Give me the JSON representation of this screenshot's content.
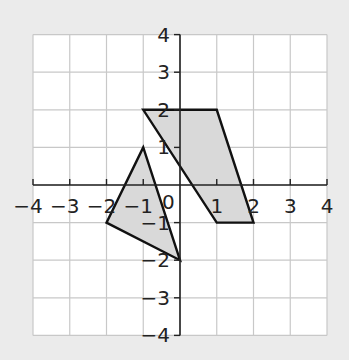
{
  "diagram": {
    "type": "coordinate-grid",
    "x_range": [
      -4,
      4
    ],
    "y_range": [
      -4,
      4
    ],
    "origin_label": "0",
    "x_tick_labels": [
      "−4",
      "−3",
      "−2",
      "−1",
      "1",
      "2",
      "3",
      "4"
    ],
    "y_tick_labels": [
      "4",
      "3",
      "2",
      "1",
      "−1",
      "−2",
      "−3",
      "−4"
    ],
    "shapes": [
      {
        "name": "triangle",
        "vertices": [
          [
            -1,
            1
          ],
          [
            -2,
            -1
          ],
          [
            0,
            -2
          ]
        ],
        "fill": "#d9d9d9",
        "stroke": "#111111"
      },
      {
        "name": "parallelogram",
        "vertices": [
          [
            -1,
            2
          ],
          [
            1,
            2
          ],
          [
            2,
            -1
          ],
          [
            1,
            -1
          ]
        ],
        "fill": "#d9d9d9",
        "stroke": "#111111"
      }
    ],
    "colors": {
      "background": "#ebebeb",
      "grid_background": "#ffffff",
      "grid_line": "#c8c8c8",
      "axis": "#222222",
      "label": "#222222"
    }
  }
}
